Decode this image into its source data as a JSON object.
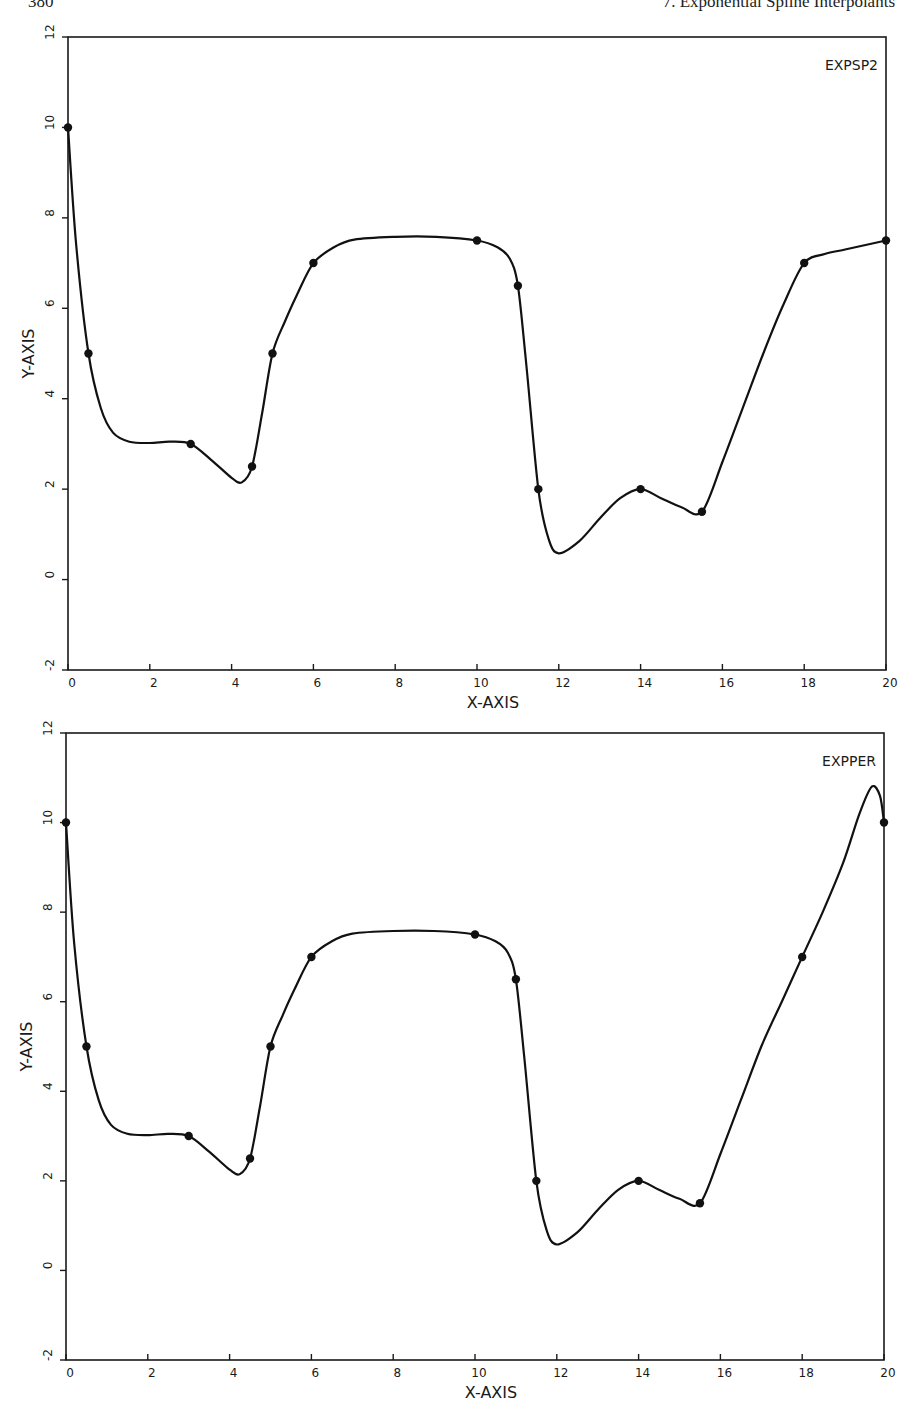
{
  "page": {
    "page_number": "380",
    "chapter_title": "7.  Exponential Spline Interpolants"
  },
  "chart_data": [
    {
      "type": "line",
      "title": "EXPSP2",
      "xlabel": "X-AXIS",
      "ylabel": "Y-AXIS",
      "xlim": [
        0,
        20
      ],
      "ylim": [
        -2,
        12
      ],
      "xticks": [
        0,
        2,
        4,
        6,
        8,
        10,
        12,
        14,
        16,
        18,
        20
      ],
      "yticks": [
        -2,
        0,
        2,
        4,
        6,
        8,
        10,
        12
      ],
      "grid": false,
      "legend": "none",
      "label_position": "top-right inside",
      "series": [
        {
          "name": "data points",
          "x": [
            0,
            0.5,
            3,
            4.5,
            5,
            6,
            10,
            11,
            11.5,
            14,
            15.5,
            18,
            20
          ],
          "y": [
            10,
            5,
            3,
            2.5,
            5,
            7,
            7.5,
            6.5,
            2,
            2,
            1.5,
            7,
            7.5
          ]
        },
        {
          "name": "exponential spline curve",
          "x": [
            0,
            0.2,
            0.5,
            0.8,
            1.1,
            1.5,
            2.0,
            2.5,
            3.0,
            3.5,
            4.0,
            4.25,
            4.5,
            4.75,
            5.0,
            5.3,
            5.6,
            6.0,
            6.5,
            7.0,
            8.0,
            9.0,
            10.0,
            10.5,
            10.8,
            11.0,
            11.2,
            11.5,
            11.75,
            12.0,
            12.5,
            13.0,
            13.5,
            14.0,
            14.5,
            15.0,
            15.5,
            16.0,
            16.5,
            17.0,
            17.5,
            18.0,
            18.5,
            19.0,
            19.5,
            20.0
          ],
          "y": [
            10,
            7.4,
            5,
            3.8,
            3.25,
            3.05,
            3.02,
            3.05,
            3.0,
            2.65,
            2.25,
            2.15,
            2.5,
            3.7,
            5,
            5.7,
            6.3,
            7,
            7.35,
            7.52,
            7.58,
            7.58,
            7.5,
            7.35,
            7.1,
            6.5,
            4.8,
            2,
            0.9,
            0.58,
            0.85,
            1.35,
            1.8,
            2,
            1.8,
            1.6,
            1.5,
            2.6,
            3.8,
            5.0,
            6.1,
            7,
            7.2,
            7.3,
            7.4,
            7.5
          ]
        }
      ]
    },
    {
      "type": "line",
      "title": "EXPPER",
      "xlabel": "X-AXIS",
      "ylabel": "Y-AXIS",
      "xlim": [
        0,
        20
      ],
      "ylim": [
        -2,
        12
      ],
      "xticks": [
        0,
        2,
        4,
        6,
        8,
        10,
        12,
        14,
        16,
        18,
        20
      ],
      "yticks": [
        -2,
        0,
        2,
        4,
        6,
        8,
        10,
        12
      ],
      "grid": false,
      "legend": "none",
      "label_position": "top-right inside",
      "series": [
        {
          "name": "data points",
          "x": [
            0,
            0.5,
            3,
            4.5,
            5,
            6,
            10,
            11,
            11.5,
            14,
            15.5,
            18,
            20
          ],
          "y": [
            10,
            5,
            3,
            2.5,
            5,
            7,
            7.5,
            6.5,
            2,
            2,
            1.5,
            7,
            10
          ]
        },
        {
          "name": "exponential spline curve",
          "x": [
            0,
            0.2,
            0.5,
            0.8,
            1.1,
            1.5,
            2.0,
            2.5,
            3.0,
            3.5,
            4.0,
            4.25,
            4.5,
            4.75,
            5.0,
            5.3,
            5.6,
            6.0,
            6.5,
            7.0,
            8.0,
            9.0,
            10.0,
            10.5,
            10.8,
            11.0,
            11.2,
            11.5,
            11.75,
            12.0,
            12.5,
            13.0,
            13.5,
            14.0,
            14.5,
            15.0,
            15.5,
            16.0,
            16.5,
            17.0,
            17.5,
            18.0,
            18.5,
            19.0,
            19.4,
            19.7,
            19.9,
            20.0
          ],
          "y": [
            10,
            7.3,
            5,
            3.8,
            3.25,
            3.05,
            3.02,
            3.05,
            3.0,
            2.65,
            2.25,
            2.15,
            2.5,
            3.7,
            5,
            5.7,
            6.3,
            7,
            7.35,
            7.52,
            7.58,
            7.58,
            7.5,
            7.35,
            7.1,
            6.5,
            4.8,
            2,
            0.9,
            0.58,
            0.85,
            1.35,
            1.8,
            2,
            1.8,
            1.6,
            1.5,
            2.6,
            3.8,
            5.0,
            6.0,
            7,
            8.0,
            9.1,
            10.2,
            10.8,
            10.6,
            10
          ]
        }
      ]
    }
  ],
  "layout": {
    "plots": [
      {
        "x0": 68,
        "x1": 886,
        "ytop": 37,
        "ybottom": 670
      },
      {
        "x0": 66,
        "x1": 884,
        "ytop": 733,
        "ybottom": 1360
      }
    ]
  }
}
